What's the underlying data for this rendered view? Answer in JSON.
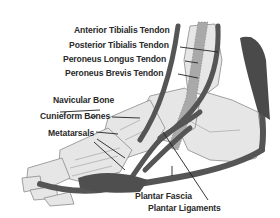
{
  "diagram": {
    "labels": {
      "anterior_tibialis": "Anterior Tibialis Tendon",
      "posterior_tibialis": "Posterior Tibialis Tendon",
      "peroneus_longus": "Peroneus Longus Tendon",
      "peroneus_brevis": "Peroneus Brevis Tendon",
      "navicular": "Navicular Bone",
      "cuneiform": "Cunieform Bones",
      "metatarsals": "Metatarsals",
      "plantar_fascia": "Plantar Fascia",
      "plantar_ligaments": "Plantar Ligaments"
    },
    "colors": {
      "bone_fill": "#e6e6e6",
      "bone_outline": "#8a8a8a",
      "tendon": "#555555",
      "ligament_band": "#a9a9a9",
      "label_text": "#2a2a2a",
      "leader_line": "#222222"
    }
  }
}
